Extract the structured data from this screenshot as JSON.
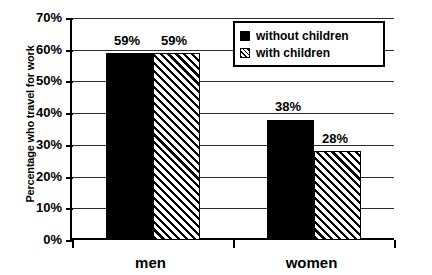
{
  "chart_data": {
    "type": "bar",
    "title": "",
    "xlabel": "",
    "ylabel": "Percentage who travel for work",
    "categories": [
      "men",
      "women"
    ],
    "series": [
      {
        "name": "without children",
        "values": [
          59,
          59
        ],
        "pattern": "solid"
      },
      {
        "name": "with children",
        "values": [
          59,
          28
        ],
        "pattern": "hatched"
      }
    ],
    "data_labels": [
      [
        "59%",
        "59%"
      ],
      [
        "38%",
        "28%"
      ]
    ],
    "corrected_series": [
      {
        "name": "without children",
        "values": [
          59,
          38
        ],
        "pattern": "solid"
      },
      {
        "name": "with children",
        "values": [
          59,
          28
        ],
        "pattern": "hatched"
      }
    ],
    "ylim": [
      0,
      70
    ],
    "ytick_values": [
      0,
      10,
      20,
      30,
      40,
      50,
      60,
      70
    ],
    "ytick_labels": [
      "0%",
      "10%",
      "20%",
      "30%",
      "40%",
      "50%",
      "60%",
      "70%"
    ],
    "grid": true,
    "legend_position": "top-right",
    "colors": {
      "bar_solid": "#000000",
      "bar_hatched_bg": "#ffffff",
      "bar_hatched_line": "#000000",
      "axis": "#000000",
      "gridline": "#2b2b2b",
      "background": "#ffffff",
      "text": "#000000"
    }
  },
  "axis": {
    "y_title": "Percentage who travel for work"
  },
  "legend": {
    "items": [
      {
        "label": "without children",
        "pattern": "solid"
      },
      {
        "label": "with children",
        "pattern": "hatched"
      }
    ]
  }
}
